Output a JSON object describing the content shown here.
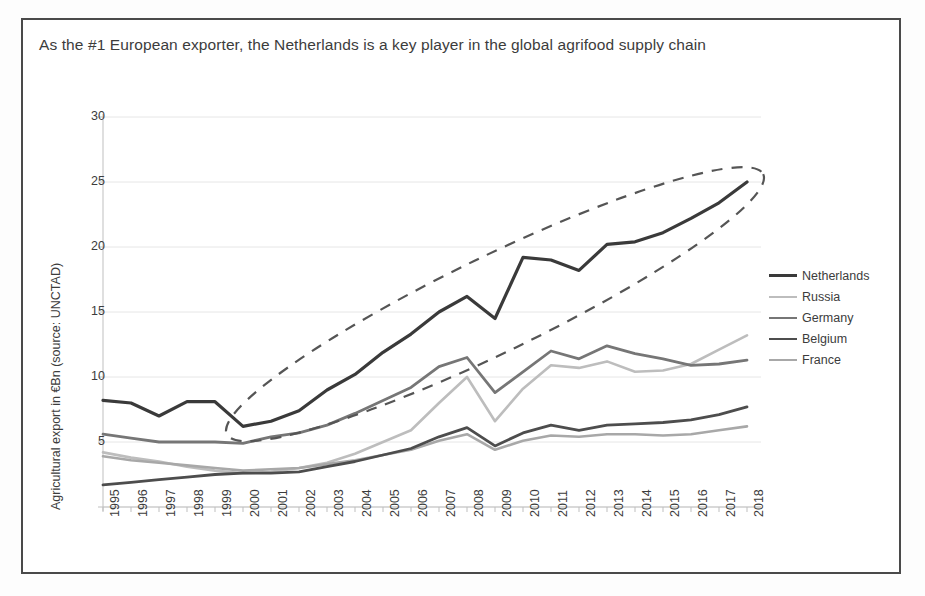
{
  "slide": {
    "title": "As the #1 European exporter, the Netherlands is a key player in the global agrifood supply chain"
  },
  "chart_data": {
    "type": "line",
    "title": "As the #1 European exporter, the Netherlands is a key player in the global agrifood supply chain",
    "xlabel": "",
    "ylabel": "Agricultural export in €Bn (source: UNCTAD)",
    "ylim": [
      0,
      30
    ],
    "yticks": [
      0,
      5,
      10,
      15,
      20,
      25,
      30
    ],
    "ytick_labels": [
      "",
      "5",
      "10",
      "15",
      "20",
      "25",
      "30"
    ],
    "grid": "horizontal",
    "legend_position": "right",
    "categories": [
      "1995",
      "1996",
      "1997",
      "1998",
      "1999",
      "2000",
      "2001",
      "2002",
      "2003",
      "2004",
      "2005",
      "2006",
      "2007",
      "2008",
      "2009",
      "2010",
      "2011",
      "2012",
      "2013",
      "2014",
      "2015",
      "2016",
      "2017",
      "2018"
    ],
    "series": [
      {
        "name": "Netherlands",
        "color": "#3a3a3a",
        "width": 3.2,
        "values": [
          8.2,
          8.0,
          7.0,
          8.1,
          8.1,
          6.2,
          6.6,
          7.4,
          9.0,
          10.2,
          11.9,
          13.3,
          15.0,
          16.2,
          14.5,
          19.2,
          19.0,
          18.2,
          20.2,
          20.4,
          21.1,
          22.2,
          23.4,
          25.0
        ]
      },
      {
        "name": "Russia",
        "color": "#bdbdbd",
        "width": 2.6,
        "values": [
          4.2,
          3.8,
          3.5,
          3.1,
          2.8,
          2.6,
          2.7,
          3.0,
          3.4,
          4.1,
          5.0,
          5.9,
          8.0,
          10.0,
          6.6,
          9.1,
          10.9,
          10.7,
          11.2,
          10.4,
          10.5,
          11.0,
          12.1,
          13.2
        ]
      },
      {
        "name": "Germany",
        "color": "#767676",
        "width": 2.8,
        "values": [
          5.6,
          5.3,
          5.0,
          5.0,
          5.0,
          4.9,
          5.4,
          5.7,
          6.3,
          7.2,
          8.2,
          9.2,
          10.8,
          11.5,
          8.8,
          10.4,
          12.0,
          11.4,
          12.4,
          11.8,
          11.4,
          10.9,
          11.0,
          11.3
        ]
      },
      {
        "name": "Belgium",
        "color": "#4d4d4d",
        "width": 2.8,
        "values": [
          1.7,
          1.9,
          2.1,
          2.3,
          2.5,
          2.6,
          2.6,
          2.7,
          3.1,
          3.5,
          4.0,
          4.5,
          5.4,
          6.1,
          4.7,
          5.7,
          6.3,
          5.9,
          6.3,
          6.4,
          6.5,
          6.7,
          7.1,
          7.7
        ]
      },
      {
        "name": "France",
        "color": "#a8a8a8",
        "width": 2.6,
        "values": [
          3.9,
          3.6,
          3.4,
          3.2,
          3.0,
          2.8,
          2.9,
          3.0,
          3.3,
          3.6,
          4.0,
          4.4,
          5.1,
          5.6,
          4.4,
          5.1,
          5.5,
          5.4,
          5.6,
          5.6,
          5.5,
          5.6,
          5.9,
          6.2
        ]
      }
    ],
    "annotations": [
      {
        "kind": "dashed-ellipse",
        "target": "Netherlands",
        "from_category": "2000",
        "to_category": "2018",
        "style": "dashed",
        "color": "#555555"
      }
    ]
  },
  "legend": {
    "items": [
      {
        "label": "Netherlands",
        "color": "#3a3a3a",
        "width": 3.2
      },
      {
        "label": "Russia",
        "color": "#bdbdbd",
        "width": 2.6
      },
      {
        "label": "Germany",
        "color": "#767676",
        "width": 2.8
      },
      {
        "label": "Belgium",
        "color": "#4d4d4d",
        "width": 2.8
      },
      {
        "label": "France",
        "color": "#a8a8a8",
        "width": 2.6
      }
    ]
  },
  "colors": {
    "frame_border": "#4a4a4a",
    "grid": "#e6e6e6",
    "axis": "#bfbfbf",
    "text": "#3c3c3c",
    "background": "#ffffff"
  }
}
